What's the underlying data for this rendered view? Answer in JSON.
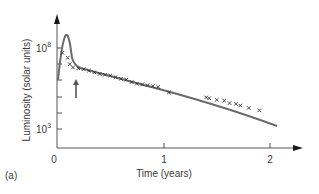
{
  "chart_data": {
    "type": "line",
    "title": "",
    "panel_label": "(a)",
    "xlabel": "Time (years)",
    "ylabel": "Luminosity (solar units)",
    "x_ticks": [
      "0",
      "1",
      "2"
    ],
    "y_tick_labels": [
      {
        "base": "10",
        "exp": "8"
      },
      {
        "base": "10",
        "exp": "3"
      }
    ],
    "y_scale": "log",
    "xlim": [
      0,
      2.2
    ],
    "ylim_log10": [
      2,
      9.5
    ],
    "grid": false,
    "annotations": [
      "arrow pointing up to the decline knee near t=0.12 yr"
    ],
    "series": [
      {
        "name": "model light curve",
        "style": "line",
        "x": [
          0.0,
          0.05,
          0.09,
          0.12,
          0.2,
          0.4,
          0.7,
          1.0,
          1.5,
          2.05
        ],
        "log10_y": [
          6.6,
          8.0,
          8.6,
          7.0,
          6.8,
          6.4,
          5.8,
          5.3,
          4.5,
          3.6
        ]
      },
      {
        "name": "observations",
        "style": "x-markers",
        "x": [
          0.05,
          0.1,
          0.12,
          0.15,
          0.2,
          0.25,
          0.3,
          0.35,
          0.4,
          0.45,
          0.5,
          0.55,
          0.6,
          0.65,
          0.7,
          0.75,
          0.8,
          0.85,
          0.9,
          0.95,
          1.05,
          1.4,
          1.43,
          1.5,
          1.57,
          1.62,
          1.68,
          1.72,
          1.8,
          1.9
        ],
        "log10_y": [
          7.7,
          7.4,
          7.0,
          6.8,
          6.75,
          6.7,
          6.6,
          6.5,
          6.4,
          6.35,
          6.3,
          6.2,
          6.1,
          6.05,
          5.9,
          5.8,
          5.75,
          5.7,
          5.65,
          5.6,
          5.25,
          4.95,
          4.9,
          4.8,
          4.75,
          4.6,
          4.55,
          4.45,
          4.3,
          4.15
        ]
      }
    ]
  }
}
